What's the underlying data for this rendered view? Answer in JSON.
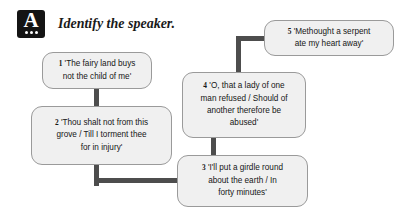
{
  "header": {
    "icon": "answer-badge-icon",
    "icon_letter": "A",
    "title": "Identify the speaker."
  },
  "theme": {
    "node_fill": "#f0f0f0",
    "node_border": "#9a9a9a",
    "connector": "#4d4d4d",
    "icon_background": "#141414",
    "text": "#161616",
    "page_background": "#ffffff"
  },
  "chart_data": {
    "type": "diagram",
    "title": "Identify the speaker.",
    "layout": "flowchart",
    "nodes": [
      {
        "id": "1",
        "number": "1",
        "lines": [
          "'The fairy land buys",
          "not the child of me'"
        ],
        "text": "'The fairy land buys not the child of me'"
      },
      {
        "id": "2",
        "number": "2",
        "lines": [
          "'Thou shalt not from this",
          "grove / Till I torment thee",
          "for in injury'"
        ],
        "text": "'Thou shalt not from this grove / Till I torment thee for in injury'"
      },
      {
        "id": "3",
        "number": "3",
        "lines": [
          "'I'll put a girdle round",
          "about the earth / In",
          "forty minutes'"
        ],
        "text": "'I'll put a girdle round about the earth / In forty minutes'"
      },
      {
        "id": "4",
        "number": "4",
        "lines": [
          "'O, that a lady of one",
          "man refused / Should of",
          "another therefore be",
          "abused'"
        ],
        "text": "'O, that a lady of one man refused / Should of another therefore be abused'"
      },
      {
        "id": "5",
        "number": "5",
        "lines": [
          "'Methought a serpent",
          "ate my heart away'"
        ],
        "text": "'Methought a serpent ate my heart away'"
      }
    ],
    "edges": [
      {
        "from": "1",
        "to": "2",
        "style": "straight-vertical"
      },
      {
        "from": "2",
        "to": "3",
        "style": "elbow-down-right"
      },
      {
        "from": "4",
        "to": "3",
        "style": "straight-vertical"
      },
      {
        "from": "4",
        "to": "5",
        "style": "elbow-up-right"
      }
    ]
  }
}
